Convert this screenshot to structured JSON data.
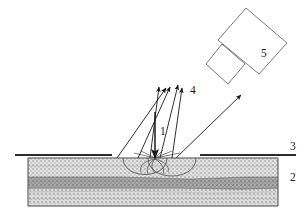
{
  "figure": {
    "background_color": "#ffffff",
    "line_color": "#3b3b3b",
    "ink_color": "#1a1a1a"
  },
  "callouts": [
    {
      "id": "1",
      "label": "1",
      "meaning": "incident-beam",
      "x": 155,
      "y": 135
    },
    {
      "id": "2",
      "label": "2",
      "meaning": "layered-substrate",
      "x": 290,
      "y": 181
    },
    {
      "id": "3",
      "label": "3",
      "meaning": "surface-line",
      "x": 290,
      "y": 150
    },
    {
      "id": "4",
      "label": "4",
      "meaning": "emitted-rays",
      "x": 190,
      "y": 94
    },
    {
      "id": "5",
      "label": "5",
      "meaning": "detector",
      "x": 261,
      "y": 57
    }
  ],
  "layers": {
    "top": {
      "name": "top-layer",
      "fill": "#d9d9d9",
      "y": 158,
      "height": 19
    },
    "middle": {
      "name": "middle-layer",
      "fill": "#9e9e9e",
      "y": 177,
      "height": 11
    },
    "bottom": {
      "name": "bottom-layer",
      "fill": "#cfcfcf",
      "y": 188,
      "height": 18
    },
    "block": {
      "x": 28,
      "width": 250,
      "y": 158,
      "height": 48
    }
  },
  "surface_lines": [
    {
      "name": "surface-line-left",
      "x1": 15,
      "x2": 112,
      "y": 155
    },
    {
      "name": "surface-line-right",
      "x1": 200,
      "x2": 296,
      "y": 155
    }
  ],
  "incident_beam": {
    "name": "incident-beam-arrow",
    "x": 155,
    "y_start": 112,
    "y_end": 158
  },
  "emitted_rays": [
    {
      "name": "emitted-ray-1",
      "x1": 150,
      "y1": 158,
      "x2": 159,
      "y2": 87
    },
    {
      "name": "emitted-ray-2",
      "x1": 117,
      "y1": 158,
      "x2": 166,
      "y2": 88
    },
    {
      "name": "emitted-ray-3",
      "x1": 138,
      "y1": 158,
      "x2": 170,
      "y2": 87
    },
    {
      "name": "emitted-ray-4",
      "x1": 160,
      "y1": 158,
      "x2": 178,
      "y2": 85
    },
    {
      "name": "emitted-ray-5",
      "x1": 172,
      "y1": 158,
      "x2": 182,
      "y2": 88
    },
    {
      "name": "emitted-ray-6",
      "x1": 176,
      "y1": 158,
      "x2": 241,
      "y2": 95
    }
  ],
  "craters": [
    {
      "name": "crater-left",
      "cx": 145,
      "cy": 158,
      "rx": 22,
      "ry": 20
    },
    {
      "name": "crater-right",
      "cx": 172,
      "cy": 158,
      "rx": 24,
      "ry": 22
    }
  ],
  "detector": {
    "name": "detector-5",
    "body": "246,8 287,43 259,74 218,40",
    "stub": "222,44 245,64 228,84 206,64"
  }
}
